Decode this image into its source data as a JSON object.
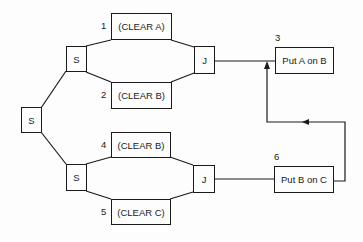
{
  "diagram": {
    "type": "procedural-net",
    "nodes": [
      {
        "id": "s_root",
        "label": "S"
      },
      {
        "id": "s_top",
        "label": "S"
      },
      {
        "id": "s_bottom",
        "label": "S"
      },
      {
        "id": "clear_a",
        "label": "(CLEAR A)",
        "number": "1"
      },
      {
        "id": "clear_b_top",
        "label": "(CLEAR B)",
        "number": "2"
      },
      {
        "id": "j_top",
        "label": "J"
      },
      {
        "id": "put_a_on_b",
        "label": "Put A on B",
        "number": "3"
      },
      {
        "id": "clear_b_bottom",
        "label": "(CLEAR B)",
        "number": "4"
      },
      {
        "id": "clear_c",
        "label": "(CLEAR C)",
        "number": "5"
      },
      {
        "id": "j_bottom",
        "label": "J"
      },
      {
        "id": "put_b_on_c",
        "label": "Put B on C",
        "number": "6"
      }
    ],
    "edges": [
      [
        "s_root",
        "s_top"
      ],
      [
        "s_root",
        "s_bottom"
      ],
      [
        "s_top",
        "clear_a"
      ],
      [
        "s_top",
        "clear_b_top"
      ],
      [
        "clear_a",
        "j_top"
      ],
      [
        "clear_b_top",
        "j_top"
      ],
      [
        "j_top",
        "put_a_on_b"
      ],
      [
        "s_bottom",
        "clear_b_bottom"
      ],
      [
        "s_bottom",
        "clear_c"
      ],
      [
        "clear_b_bottom",
        "j_bottom"
      ],
      [
        "clear_c",
        "j_bottom"
      ],
      [
        "j_bottom",
        "put_b_on_c"
      ],
      [
        "put_b_on_c",
        "put_a_on_b"
      ]
    ]
  }
}
